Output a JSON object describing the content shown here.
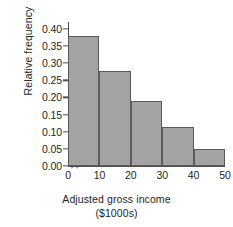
{
  "chart_data": {
    "type": "bar",
    "title": "",
    "subtitle": "",
    "xlabel_line1": "Adjusted gross income",
    "xlabel_line2": "($1000s)",
    "ylabel": "Relative frequency",
    "categories": [
      "0-10",
      "10-20",
      "20-30",
      "30-40",
      "40-50"
    ],
    "bin_edges": [
      0,
      10,
      20,
      30,
      40,
      50
    ],
    "bin_width": 10,
    "values": [
      0.38,
      0.278,
      0.191,
      0.113,
      0.05
    ],
    "x": [
      0,
      10,
      20,
      30,
      40,
      50
    ],
    "xtick_labels": [
      "0",
      "10",
      "20",
      "30",
      "40",
      "50"
    ],
    "ytick_values": [
      0.0,
      0.05,
      0.1,
      0.15,
      0.2,
      0.25,
      0.3,
      0.35,
      0.4
    ],
    "ytick_labels": [
      "0.00",
      "0.05",
      "0.10",
      "0.15",
      "0.20",
      "0.25",
      "0.30",
      "0.35",
      "0.40"
    ],
    "ylim": [
      0.0,
      0.42
    ],
    "xlim": [
      0,
      50
    ],
    "grid": false,
    "legend": false,
    "axis_break": "//",
    "bar_fill_color": "#a3a3a3",
    "bar_edge_color": "#5a5a5a",
    "axis_color": "#4d4d4d",
    "text_color": "#231f20",
    "background_color": "#ffffff"
  }
}
